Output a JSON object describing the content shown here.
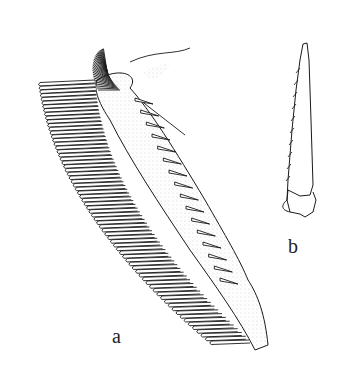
{
  "figure": {
    "labels": {
      "a": "a",
      "b": "b"
    },
    "colors": {
      "ink": "#1a1a1a",
      "stipple": "#9a9a9a",
      "background": "#ffffff"
    }
  }
}
